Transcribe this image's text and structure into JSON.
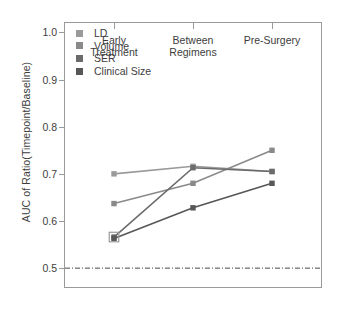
{
  "chart_data": {
    "type": "line",
    "title": "",
    "xlabel": "",
    "ylabel": "AUC of Ratio(Timepoint/Baseline)",
    "categories": [
      "Early\nTreatment",
      "Between\nRegimens",
      "Pre-Surgery"
    ],
    "category_labels": [
      {
        "line1": "Early",
        "line2": "Treatment"
      },
      {
        "line1": "Between",
        "line2": "Regimens"
      },
      {
        "line1": "Pre-Surgery",
        "line2": ""
      }
    ],
    "ylim": [
      0.46,
      1.02
    ],
    "yticks": [
      0.5,
      0.6,
      0.7,
      0.8,
      0.9,
      1.0
    ],
    "ytick_labels": [
      "0.5",
      "0.6",
      "0.7",
      "0.8",
      "0.9",
      "1.0"
    ],
    "grid": false,
    "legend_position": "top-left",
    "reference_line": {
      "value": 0.5,
      "style": "dash-dot",
      "color": "#4a4a4a"
    },
    "series": [
      {
        "name": "LD",
        "values": [
          0.7,
          0.716,
          0.705
        ],
        "color": "#9a9a9a"
      },
      {
        "name": "Volume",
        "values": [
          0.637,
          0.68,
          0.75
        ],
        "color": "#8a8a8a"
      },
      {
        "name": "SER",
        "values": [
          0.566,
          0.713,
          0.705
        ],
        "color": "#6b6b6b"
      },
      {
        "name": "Clinical Size",
        "values": [
          0.563,
          0.628,
          0.68
        ],
        "color": "#575757"
      }
    ],
    "highlight_marker": {
      "series": "SER",
      "category_index": 0,
      "value": 0.566
    }
  },
  "legend": {
    "items": [
      {
        "label": "LD",
        "color": "#9a9a9a"
      },
      {
        "label": "Volume",
        "color": "#8a8a8a"
      },
      {
        "label": "SER",
        "color": "#6b6b6b"
      },
      {
        "label": "Clinical Size",
        "color": "#575757"
      }
    ]
  },
  "colors": {
    "axis": "#9a9a9a",
    "text": "#3d3d3d",
    "background": "#ffffff"
  }
}
